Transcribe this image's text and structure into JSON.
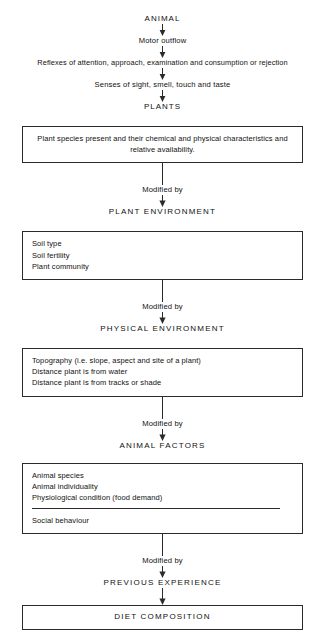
{
  "diagram": {
    "line_color": "#2b2b2b",
    "background": "#ffffff",
    "connector_label": "Modified by",
    "top_chain": [
      "ANIMAL",
      "Motor outflow",
      "Reflexes of attention, approach, examination and consumption or rejection",
      "Senses of sight, smell, touch and taste",
      "PLANTS"
    ],
    "stages": [
      {
        "box_lines": [
          "Plant species present and their chemical and physical characteristics and",
          "relative availability."
        ],
        "box_align": "center",
        "connector_label": "Modified by",
        "caption": "PLANT ENVIRONMENT"
      },
      {
        "box_lines": [
          "Soil type",
          "Soil fertility",
          "Plant community"
        ],
        "box_align": "left",
        "connector_label": "Modified by",
        "caption": "PHYSICAL ENVIRONMENT"
      },
      {
        "box_lines": [
          "Topography (i.e. slope, aspect and site of a plant)",
          "Distance plant is from water",
          "Distance plant is from tracks or shade"
        ],
        "box_align": "left",
        "connector_label": "Modified by",
        "caption": "ANIMAL FACTORS"
      },
      {
        "box_lines": [
          "Animal species",
          "Animal individuality",
          "Physiological condition (food demand)"
        ],
        "box_lines_after_rule": [
          "Social behaviour"
        ],
        "box_align": "left",
        "connector_label": "Modified by",
        "caption": "PREVIOUS EXPERIENCE"
      }
    ],
    "result_box": "DIET COMPOSITION"
  }
}
